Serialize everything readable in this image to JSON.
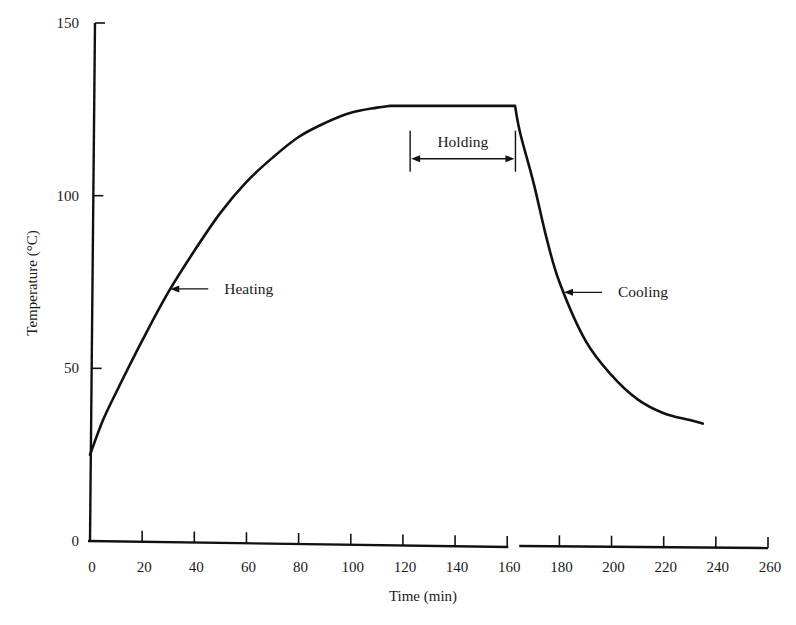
{
  "chart_data": {
    "type": "line",
    "title": "",
    "xlabel": "Time (min)",
    "ylabel": "Temperature (°C)",
    "xlim": [
      0,
      260
    ],
    "ylim": [
      0,
      150
    ],
    "x_ticks": [
      0,
      20,
      40,
      60,
      80,
      100,
      120,
      140,
      160,
      180,
      200,
      220,
      240,
      260
    ],
    "y_ticks": [
      0,
      50,
      100,
      150
    ],
    "x_axis_break_after": 160,
    "grid": false,
    "legend": null,
    "series": [
      {
        "name": "Temperature profile",
        "x": [
          0,
          5,
          10,
          20,
          30,
          40,
          50,
          60,
          70,
          80,
          90,
          100,
          110,
          115,
          163,
          165,
          170,
          175,
          180,
          190,
          200,
          210,
          220,
          230,
          235
        ],
        "y": [
          25,
          35,
          43,
          58,
          72,
          84,
          95,
          104,
          111,
          117,
          121,
          124,
          125.5,
          126,
          126,
          118,
          104,
          88,
          75,
          58,
          48,
          41,
          37,
          35,
          34
        ]
      }
    ],
    "annotations": [
      {
        "text": "Heating",
        "x": 30,
        "y": 73,
        "type": "arrow-label"
      },
      {
        "text": "Holding",
        "x_start": 122,
        "x_end": 162,
        "y": 111,
        "type": "bracket-label"
      },
      {
        "text": "Cooling",
        "x": 181,
        "y": 72,
        "type": "arrow-label"
      }
    ]
  },
  "labels": {
    "xlabel": "Time (min)",
    "ylabel": "Temperature (°C)",
    "heating": "Heating",
    "holding": "Holding",
    "cooling": "Cooling"
  }
}
